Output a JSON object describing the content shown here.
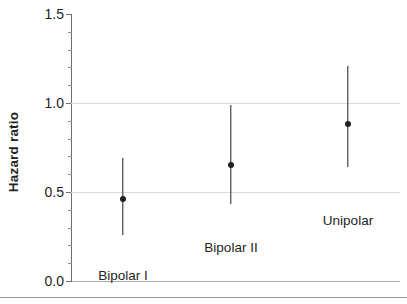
{
  "chart_data": {
    "type": "scatter",
    "title": "",
    "xlabel": "",
    "ylabel": "Hazard ratio",
    "ylim": [
      0.0,
      1.5
    ],
    "ytick_labels": [
      "0.0",
      "0.5",
      "1.0",
      "1.5"
    ],
    "ytick_values": [
      0.0,
      0.5,
      1.0,
      1.5
    ],
    "yminor_step": 0.1,
    "gridlines": [
      0.5,
      1.0
    ],
    "grid": true,
    "legend": "none",
    "categories": [
      "Bipolar I",
      "Bipolar II",
      "Unipolar"
    ],
    "values": [
      0.46,
      0.65,
      0.88
    ],
    "ci_low": [
      0.26,
      0.43,
      0.64
    ],
    "ci_high": [
      0.69,
      0.99,
      1.21
    ],
    "points": [
      {
        "category": "Bipolar I",
        "estimate": 0.46,
        "ci_low": 0.26,
        "ci_high": 0.69,
        "label": "Bipolar I"
      },
      {
        "category": "Bipolar II",
        "estimate": 0.65,
        "ci_low": 0.43,
        "ci_high": 0.99,
        "label": "Bipolar II"
      },
      {
        "category": "Unipolar",
        "estimate": 0.88,
        "ci_low": 0.64,
        "ci_high": 1.21,
        "label": "Unipolar"
      }
    ]
  },
  "axis": {
    "y_title": "Hazard ratio",
    "tick_0": "0.0",
    "tick_1": "0.5",
    "tick_2": "1.0",
    "tick_3": "1.5"
  },
  "labels": {
    "cat_0": "Bipolar I",
    "cat_1": "Bipolar II",
    "cat_2": "Unipolar"
  },
  "colors": {
    "marker": "#231f20",
    "grid": "#d9d9d9",
    "axis": "#6d6e71",
    "rule": "#939598",
    "background": "#ffffff"
  }
}
